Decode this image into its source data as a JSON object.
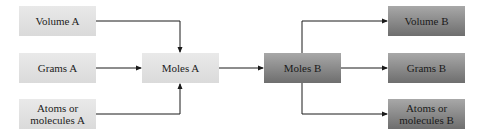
{
  "diagram": {
    "colors": {
      "source_box_top": "#e9e9e9",
      "source_box_bottom": "#dadada",
      "target_box_top": "#a8a8a8",
      "target_box_bottom": "#6e6e6e",
      "arrow": "#1a1a1a",
      "text": "#222222"
    },
    "nodes": {
      "volume_a": {
        "label": "Volume A"
      },
      "grams_a": {
        "label": "Grams A"
      },
      "atoms_a": {
        "label_line1": "Atoms or",
        "label_line2": "molecules A"
      },
      "moles_a": {
        "label": "Moles A"
      },
      "moles_b": {
        "label": "Moles B"
      },
      "volume_b": {
        "label": "Volume B"
      },
      "grams_b": {
        "label": "Grams B"
      },
      "atoms_b": {
        "label_line1": "Atoms or",
        "label_line2": "molecules B"
      }
    },
    "edges": [
      {
        "from": "Volume A",
        "to": "Moles A"
      },
      {
        "from": "Grams A",
        "to": "Moles A"
      },
      {
        "from": "Atoms or molecules A",
        "to": "Moles A"
      },
      {
        "from": "Moles A",
        "to": "Moles B"
      },
      {
        "from": "Moles B",
        "to": "Volume B"
      },
      {
        "from": "Moles B",
        "to": "Grams B"
      },
      {
        "from": "Moles B",
        "to": "Atoms or molecules B"
      }
    ]
  }
}
